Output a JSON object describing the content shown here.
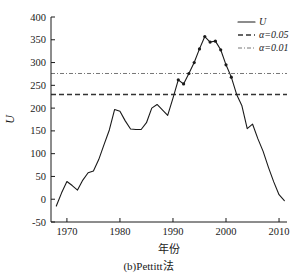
{
  "chart_data": {
    "type": "line",
    "title": "",
    "caption": "(b)Pettitt法",
    "xlabel": "年份",
    "ylabel": "U",
    "xlim": [
      1967,
      2011.5
    ],
    "ylim": [
      -50,
      400
    ],
    "xticks": [
      1970,
      1980,
      1990,
      2000,
      2010
    ],
    "xtick_labels": [
      "1970",
      "1980",
      "1990",
      "2000",
      "2010"
    ],
    "yticks": [
      -50,
      0,
      50,
      100,
      150,
      200,
      250,
      300,
      350,
      400
    ],
    "ytick_labels": [
      "-50",
      "0",
      "50",
      "100",
      "150",
      "200",
      "250",
      "300",
      "350",
      "400"
    ],
    "grid": false,
    "legend_position": "top-right",
    "series": [
      {
        "name": "U",
        "style": "solid",
        "color": "#1a1a1a",
        "x": [
          1968,
          1969,
          1970,
          1971,
          1972,
          1973,
          1974,
          1975,
          1976,
          1977,
          1978,
          1979,
          1980,
          1981,
          1982,
          1983,
          1984,
          1985,
          1986,
          1987,
          1988,
          1989,
          1990,
          1991,
          1992,
          1993,
          1994,
          1995,
          1996,
          1997,
          1998,
          1999,
          2000,
          2001,
          2002,
          2003,
          2004,
          2005,
          2006,
          2007,
          2008,
          2009,
          2010,
          2011
        ],
        "values": [
          -15,
          14,
          39,
          30,
          20,
          42,
          58,
          62,
          87,
          120,
          152,
          197,
          193,
          172,
          154,
          153,
          153,
          168,
          200,
          208,
          196,
          184,
          222,
          262,
          253,
          276,
          300,
          330,
          357,
          345,
          347,
          328,
          295,
          268,
          230,
          205,
          155,
          165,
          133,
          105,
          70,
          38,
          10,
          -3
        ],
        "marker_from_x": 1991,
        "marker_to_x": 2001
      },
      {
        "name": "α=0.05",
        "style": "dashed",
        "color": "#333333",
        "value": 230
      },
      {
        "name": "α=0.01",
        "style": "dash-dot",
        "color": "#777777",
        "value": 276
      }
    ],
    "legend": [
      {
        "label": "U",
        "style": "solid",
        "italic": true
      },
      {
        "label": "α=0.05",
        "style": "dashed",
        "italic": true
      },
      {
        "label": "α=0.01",
        "style": "dash-dot",
        "italic": true
      }
    ]
  }
}
